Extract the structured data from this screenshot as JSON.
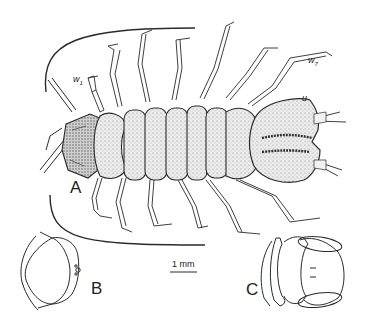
{
  "figure": {
    "panels": [
      {
        "id": "A",
        "label": "A",
        "description": "whole animal, dorsal view"
      },
      {
        "id": "B",
        "label": "B",
        "description": "head capsule, lateral outline"
      },
      {
        "id": "C",
        "label": "C",
        "description": "pygidium / terminal segment outline"
      }
    ],
    "annotations": {
      "w1": {
        "base": "w",
        "sub": "1"
      },
      "w7": {
        "base": "w",
        "sub": "7"
      },
      "u": "u"
    },
    "scale_bar": {
      "label": "1 mm"
    },
    "colors": {
      "line": "#2a2a2a",
      "stipple": "#9a9a9a",
      "fill": "#e6e6e6",
      "background": "#ffffff"
    }
  }
}
